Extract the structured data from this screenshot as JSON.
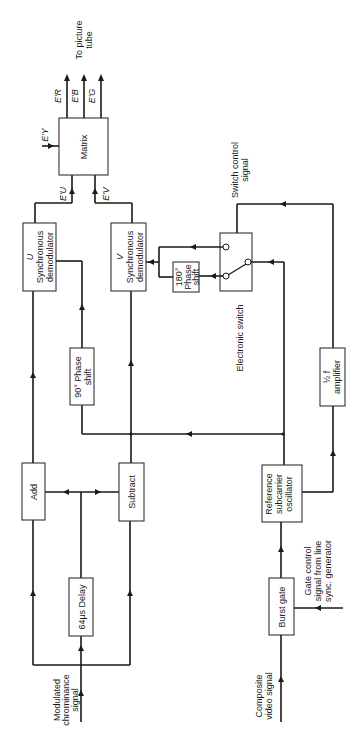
{
  "diagram": {
    "type": "block-diagram",
    "orientation": "rotated-90-ccw",
    "blocks": {
      "delay": "64μs Delay",
      "add": "Add",
      "subtract": "Subtract",
      "u_demod_a": "U",
      "u_demod_b": "Synchronous",
      "u_demod_c": "demodulator",
      "v_demod_a": "V",
      "v_demod_b": "Synchronous",
      "v_demod_c": "demodulator",
      "phase90_a": "90° Phase",
      "phase90_b": "shift",
      "matrix": "Matrix",
      "phase180_a": "180°",
      "phase180_b": "Phase",
      "phase180_c": "shift",
      "burst_gate": "Burst gate",
      "ref_osc_a": "Reference",
      "ref_osc_b": "subcarrier",
      "ref_osc_c": "oscillator",
      "tuned_amp_a": "½ f",
      "tuned_amp_b": "Tuned",
      "tuned_amp_c": "amplifier",
      "electronic_switch": "Electronic switch"
    },
    "signals": {
      "chroma_a": "Modulated",
      "chroma_b": "chrominance",
      "chroma_c": "signal",
      "composite_a": "Composite",
      "composite_b": "video signal",
      "gate_ctrl_a": "Gate control",
      "gate_ctrl_b": "signal from line",
      "gate_ctrl_c": "sync. generator",
      "switch_ctrl_a": "Switch control",
      "switch_ctrl_b": "signal",
      "eu": "E'U",
      "ev": "E'V",
      "ey": "E'Y",
      "er": "E'R",
      "eb": "E'B",
      "eg": "E'G",
      "to_tube_a": "To picture",
      "to_tube_b": "tube"
    }
  }
}
